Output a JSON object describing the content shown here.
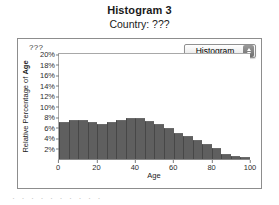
{
  "title": {
    "main": "Histogram 3",
    "subtitle": "Country: ???"
  },
  "panel": {
    "corner_label": "???",
    "popup": {
      "label": "Histogram",
      "arrows_icon": "up-down-arrows-icon"
    }
  },
  "footer": {
    "clipped_text": "· · ·  · ·   · ·  · ·   ·"
  },
  "chart_data": {
    "type": "bar",
    "title": "Histogram 3",
    "subtitle": "Country: ???",
    "xlabel": "Age",
    "ylabel": "Relative Percentage of Age",
    "xlim": [
      0,
      100
    ],
    "ylim": [
      0,
      20
    ],
    "grid": false,
    "legend": false,
    "bar_color": "#5f5f5f",
    "xticks": [
      0,
      20,
      40,
      60,
      80,
      100
    ],
    "xtick_labels": [
      "0",
      "20",
      "40",
      "60",
      "80",
      "100"
    ],
    "yticks": [
      2,
      4,
      6,
      8,
      10,
      12,
      14,
      16,
      18,
      20
    ],
    "ytick_labels": [
      "2%",
      "4%",
      "6%",
      "8%",
      "10%",
      "12%",
      "14%",
      "16%",
      "18%",
      "20%"
    ],
    "bin_width": 5,
    "categories": [
      "0-5",
      "5-10",
      "10-15",
      "15-20",
      "20-25",
      "25-30",
      "30-35",
      "35-40",
      "40-45",
      "45-50",
      "50-55",
      "55-60",
      "60-65",
      "65-70",
      "70-75",
      "75-80",
      "80-85",
      "85-90",
      "90-95",
      "95-100"
    ],
    "values": [
      7.0,
      7.4,
      7.4,
      7.0,
      6.7,
      7.0,
      7.5,
      7.9,
      7.9,
      7.2,
      6.6,
      5.9,
      5.0,
      4.3,
      3.6,
      2.9,
      2.1,
      1.0,
      0.5,
      0.4
    ]
  }
}
